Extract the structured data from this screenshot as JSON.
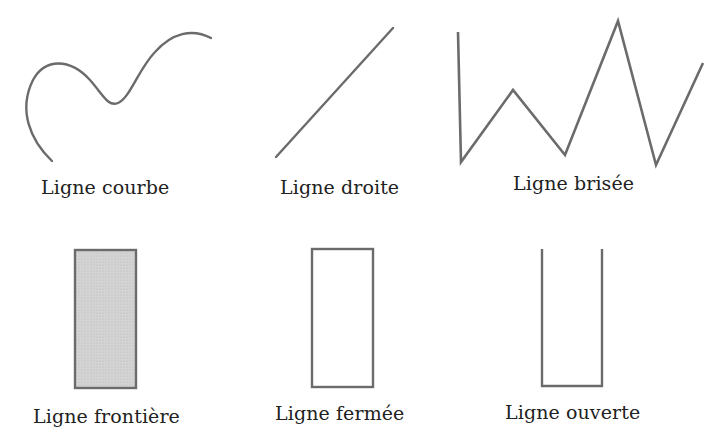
{
  "diagram": {
    "colors": {
      "stroke": "#6b6b6b",
      "fill_frontier": "#d0d0d0",
      "text": "#222222",
      "background": "#ffffff"
    },
    "items": [
      {
        "id": "curve",
        "label": "Ligne courbe"
      },
      {
        "id": "straight",
        "label": "Ligne droite"
      },
      {
        "id": "broken",
        "label": "Ligne brisée"
      },
      {
        "id": "frontier",
        "label": "Ligne frontière"
      },
      {
        "id": "closed",
        "label": "Ligne fermée"
      },
      {
        "id": "open",
        "label": "Ligne ouverte"
      }
    ]
  }
}
